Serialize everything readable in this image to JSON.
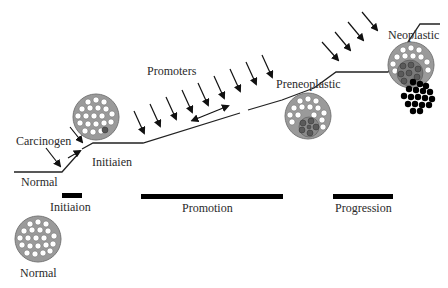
{
  "diagram": {
    "path_labels": {
      "normal": "Normal",
      "carcinogen": "Carcinogen",
      "initiated": "Initiaien",
      "promoters": "Promoters",
      "preneoplastic": "Preneoplastic",
      "neoplastic": "Neoplastic"
    },
    "stages": [
      {
        "label": "Initiaion"
      },
      {
        "label": "Promotion"
      },
      {
        "label": "Progression"
      }
    ],
    "legend_cell_label": "Normal",
    "caption": "Fig. ... (caption text cut off at bottom edge)",
    "colors": {
      "line": "#222222",
      "cell_fill": "#9a9a9a",
      "cell_nucleus_normal": "#ffffff",
      "cell_nucleus_altered": "#666666",
      "tumor_cells": "#000000",
      "bar": "#000000"
    }
  }
}
